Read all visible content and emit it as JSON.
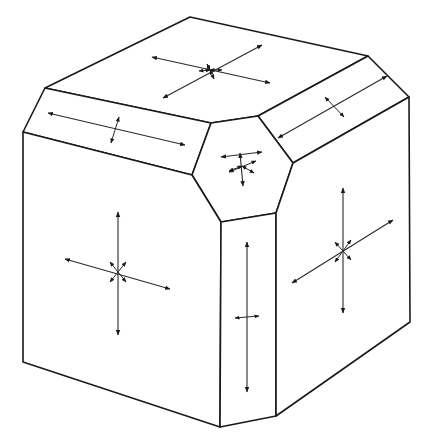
{
  "figure": {
    "type": "beveled-cube-crystal",
    "colors": {
      "line": "#1a1a1a",
      "arrow": "#2a2a2a",
      "background": "#ffffff"
    }
  },
  "faces": [
    {
      "name": "top-face",
      "points": "190,17 368,56 258,116 211,123 45,88"
    },
    {
      "name": "left-bevel",
      "points": "45,88 211,123 192,175 23,132"
    },
    {
      "name": "right-bevel",
      "points": "368,56 409,97 293,163 258,116"
    },
    {
      "name": "corner-hexagon",
      "points": "211,123 258,116 293,163 276,213 221,222 192,175"
    },
    {
      "name": "front-left-face",
      "points": "23,132 192,175 221,222 220,427 23,362"
    },
    {
      "name": "front-bevel",
      "points": "221,222 276,213 276,416 220,427"
    },
    {
      "name": "right-face",
      "points": "293,163 409,97 410,322 276,416 276,213"
    }
  ],
  "arrows": {
    "top-face": [
      [
        152,
        57,
        270,
        83
      ],
      [
        163,
        98,
        262,
        45
      ],
      [
        207,
        64,
        210,
        70
      ],
      [
        210,
        70,
        214,
        79
      ],
      [
        199,
        71,
        210,
        70
      ],
      [
        210,
        70,
        222,
        70
      ]
    ],
    "left-bevel": [
      [
        48,
        113,
        185,
        145
      ],
      [
        119,
        117,
        111,
        143
      ]
    ],
    "right-bevel": [
      [
        278,
        138,
        387,
        76
      ],
      [
        325,
        97,
        344,
        117
      ]
    ],
    "corner-hexagon": [
      [
        240,
        153,
        243,
        186
      ],
      [
        221,
        157,
        262,
        152
      ],
      [
        229,
        172,
        256,
        161
      ],
      [
        242,
        166,
        254,
        173
      ],
      [
        229,
        171,
        242,
        166
      ]
    ],
    "front-left-face": [
      [
        118,
        212,
        118,
        335
      ],
      [
        65,
        259,
        170,
        289
      ],
      [
        110,
        262,
        126,
        282
      ],
      [
        126,
        262,
        110,
        282
      ]
    ],
    "front-bevel": [
      [
        247,
        242,
        247,
        392
      ],
      [
        235,
        318,
        259,
        316
      ]
    ],
    "right-face": [
      [
        343,
        188,
        343,
        313
      ],
      [
        292,
        283,
        393,
        220
      ],
      [
        335,
        242,
        351,
        260
      ],
      [
        351,
        240,
        335,
        262
      ]
    ]
  },
  "labels": []
}
